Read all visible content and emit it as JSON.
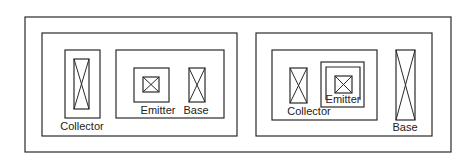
{
  "diagram": {
    "background": "#ffffff",
    "stroke_color": "#2a2a2a",
    "left_layout": {
      "collector_label": "Collector",
      "emitter_label": "Emitter",
      "base_label": "Base"
    },
    "right_layout": {
      "collector_label": "Collector",
      "emitter_label": "Emitter",
      "base_label": "Base"
    }
  }
}
